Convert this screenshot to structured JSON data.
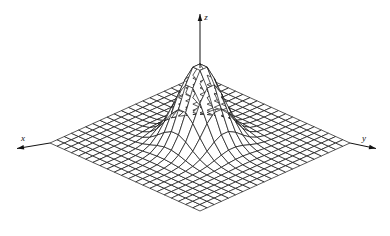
{
  "figure": {
    "title": "",
    "background_color": "#ffffff",
    "line_color": "#111111",
    "axes": {
      "x": {
        "label": "x",
        "label_x": 23,
        "label_y": 141,
        "arrow": "left",
        "tip_x": 17,
        "tip_y": 148.5,
        "base_x": 50,
        "base_y": 143
      },
      "y": {
        "label": "y",
        "label_x": 364,
        "label_y": 141,
        "arrow": "right",
        "tip_x": 376,
        "tip_y": 148.5,
        "base_x": 350,
        "base_y": 143
      },
      "z": {
        "label": "z",
        "label_x": 206,
        "label_y": 20,
        "arrow": "up",
        "tip_x": 200,
        "tip_y": 14,
        "base_x": 200,
        "base_y": 68
      }
    }
  },
  "chart_data": {
    "type": "surface",
    "title": "",
    "xlabel": "x",
    "ylabel": "y",
    "zlabel": "z",
    "function": "bivariate-gaussian",
    "grid": {
      "nx": 22,
      "ny": 22
    },
    "x": {
      "min": -3.0,
      "max": 3.0,
      "ticks": false
    },
    "y": {
      "min": -3.0,
      "max": 3.0,
      "ticks": false
    },
    "z": {
      "min": 0.0,
      "max": 1.0,
      "ticks": false
    },
    "params": {
      "amplitude": 1.0,
      "sigma_x": 0.62,
      "sigma_y": 0.62,
      "mu_x": 0.0,
      "mu_y": 0.0
    },
    "projection": {
      "type": "oblique-isometric",
      "center_x": 200,
      "center_y": 143,
      "half_width": 150,
      "half_depth": 68,
      "height_scale": 80
    },
    "grid_on": true,
    "legend": "none",
    "annotations": []
  }
}
